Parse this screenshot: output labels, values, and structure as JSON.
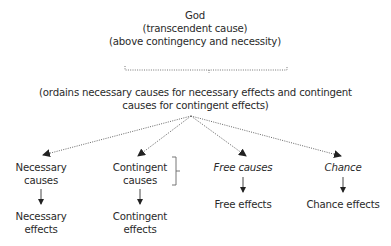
{
  "top": {
    "title": "God",
    "line2": "(transcendent cause)",
    "line3": "(above contingency and necessity)"
  },
  "middle": {
    "line1": "(ordains necessary causes for necessary effects and contingent",
    "line2": "causes for contingent effects)"
  },
  "columns": [
    {
      "cause_line1": "Necessary",
      "cause_line2": "causes",
      "effect_line1": "Necessary",
      "effect_line2": "effects",
      "italic": false
    },
    {
      "cause_line1": "Contingent",
      "cause_line2": "causes",
      "effect_line1": "Contingent",
      "effect_line2": "effects",
      "italic": false
    },
    {
      "cause_line1": "Free causes",
      "effect_line1": "Free effects",
      "italic": true
    },
    {
      "cause_line1": "Chance",
      "effect_line1": "Chance effects",
      "italic": true
    }
  ],
  "colors": {
    "text": "#2a2a2a",
    "lines": "#555555"
  }
}
